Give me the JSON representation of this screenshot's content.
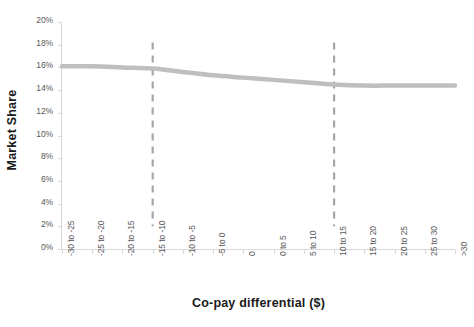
{
  "chart_data": {
    "type": "line",
    "title": "",
    "xlabel": "Co-pay differential ($)",
    "ylabel": "Market Share",
    "categories": [
      "-30 to -25",
      "-25 to -20",
      "-20 to -15",
      "-15 to -10",
      "-10 to -5",
      "-5 to 0",
      "0",
      "0 to 5",
      "5 to 10",
      "10 to 15",
      "15 to 20",
      "20 to 25",
      "25 to 30",
      ">30"
    ],
    "series": [
      {
        "name": "Market Share",
        "values": [
          16.1,
          16.1,
          16.0,
          15.9,
          15.6,
          15.3,
          15.1,
          14.9,
          14.7,
          14.5,
          14.4,
          14.4,
          14.4,
          14.4
        ]
      }
    ],
    "ylim": [
      0,
      20
    ],
    "ytick_labels": [
      "0%",
      "2%",
      "4%",
      "6%",
      "8%",
      "10%",
      "12%",
      "14%",
      "16%",
      "18%",
      "20%"
    ],
    "ytick_values": [
      0,
      2,
      4,
      6,
      8,
      10,
      12,
      14,
      16,
      18,
      20
    ],
    "grid": false,
    "legend": "none",
    "annotations": [
      {
        "name": "reference-line-left",
        "type": "vertical-dashed-line",
        "at_category": "-15 to -10"
      },
      {
        "name": "reference-line-right",
        "type": "vertical-dashed-line",
        "at_category": "10 to 15"
      }
    ],
    "colors": {
      "series_line": "#bfbfbf",
      "reference_line": "#a6a6a6",
      "axis": "#d9d9d9",
      "tick_text": "#595959",
      "title_text": "#1a1a1a",
      "background": "#ffffff"
    }
  }
}
